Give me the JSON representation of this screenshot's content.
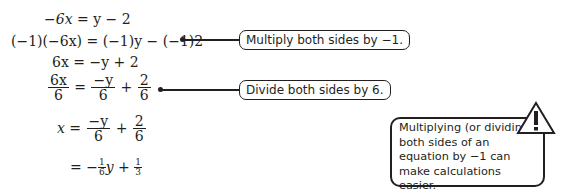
{
  "steps": [
    {
      "lhs": "−6x",
      "rhs": "y − 2"
    },
    {
      "lhs": "(−1)(−6x)",
      "rhs": "(−1)y − (−1)2"
    },
    {
      "lhs": "6x",
      "rhs": "−y + 2"
    },
    {
      "lhs_num": "6x",
      "lhs_den": "6",
      "r1_num": "−y",
      "r1_den": "6",
      "op": "+",
      "r2_num": "2",
      "r2_den": "6"
    },
    {
      "lhs": "x",
      "r1_num": "−y",
      "r1_den": "6",
      "op": "+",
      "r2_num": "2",
      "r2_den": "6"
    },
    {
      "eq": "=",
      "neg": "−",
      "c1_num": "1",
      "c1_den": "6",
      "var": "y",
      "op": "+",
      "c2_num": "1",
      "c2_den": "3"
    }
  ],
  "callouts": [
    {
      "text": "Multiply both sides by −1."
    },
    {
      "text": "Divide both sides by 6."
    }
  ],
  "tip": {
    "icon": "warning-icon",
    "text": "Multiplying (or dividing) both sides of an equation by −1 can make calculations easier."
  }
}
